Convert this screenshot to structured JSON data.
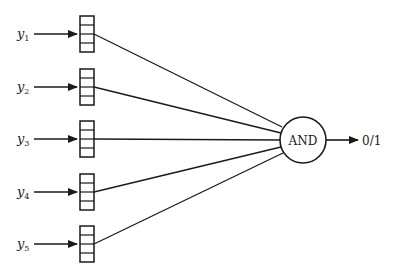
{
  "diagram": {
    "type": "and-gate-network",
    "inputs": [
      {
        "var": "y",
        "sub": "1"
      },
      {
        "var": "y",
        "sub": "2"
      },
      {
        "var": "y",
        "sub": "3"
      },
      {
        "var": "y",
        "sub": "4"
      },
      {
        "var": "y",
        "sub": "5"
      }
    ],
    "register_cells": 4,
    "gate": {
      "label": "AND"
    },
    "output": {
      "label": "0/1"
    }
  }
}
